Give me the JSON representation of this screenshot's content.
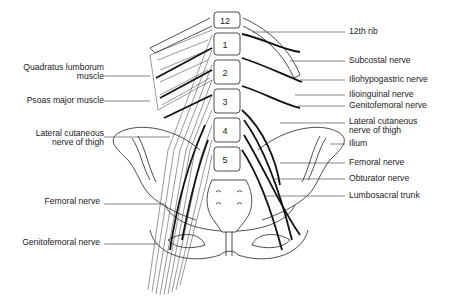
{
  "figure": {
    "vertebrae_labels": [
      "12",
      "1",
      "2",
      "3",
      "4",
      "5"
    ],
    "left_labels": [
      {
        "id": "quadratus",
        "lines": [
          "Quadratus lumborum",
          "muscle"
        ]
      },
      {
        "id": "psoas",
        "lines": [
          "Psoas major muscle"
        ]
      },
      {
        "id": "lat-cut-left",
        "lines": [
          "Lateral cutaneous",
          "nerve of thigh"
        ]
      },
      {
        "id": "femoral-left",
        "lines": [
          "Femoral nerve"
        ]
      },
      {
        "id": "genitofemoral-left",
        "lines": [
          "Genitofemoral nerve"
        ]
      }
    ],
    "right_labels": [
      {
        "id": "rib12",
        "lines": [
          "12th rib"
        ]
      },
      {
        "id": "subcostal",
        "lines": [
          "Subcostal nerve"
        ]
      },
      {
        "id": "iliohypogastric",
        "lines": [
          "Iliohypogastric nerve"
        ]
      },
      {
        "id": "ilioinguinal",
        "lines": [
          "Ilioinguinal nerve"
        ]
      },
      {
        "id": "genitofemoral-right",
        "lines": [
          "Genitofemoral nerve"
        ]
      },
      {
        "id": "lat-cut-right",
        "lines": [
          "Lateral cutaneous",
          "nerve of thigh"
        ]
      },
      {
        "id": "ilium",
        "lines": [
          "Ilium"
        ]
      },
      {
        "id": "femoral-right",
        "lines": [
          "Femoral nerve"
        ]
      },
      {
        "id": "obturator",
        "lines": [
          "Obturator nerve"
        ]
      },
      {
        "id": "lumbosacral",
        "lines": [
          "Lumbosacral trunk"
        ]
      }
    ],
    "caption": ""
  }
}
